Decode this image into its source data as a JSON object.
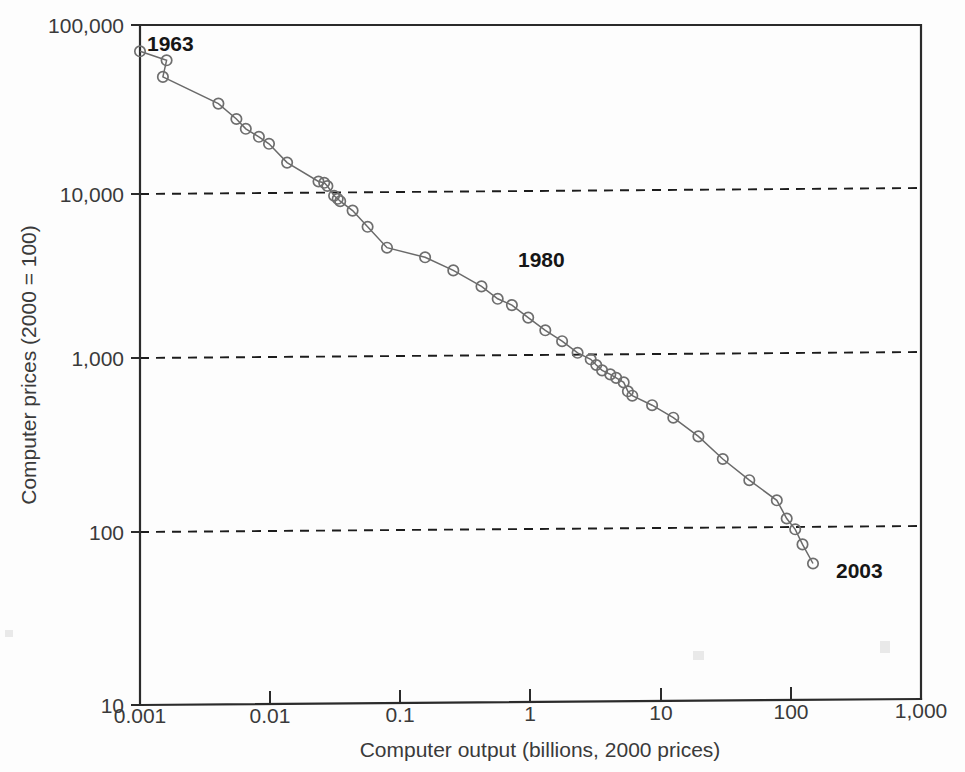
{
  "chart_data": {
    "type": "line",
    "title": "",
    "xlabel": "Computer output (billions, 2000 prices)",
    "ylabel": "Computer prices (2000 = 100)",
    "xscale": "log",
    "yscale": "log",
    "xlim": [
      0.001,
      1000
    ],
    "ylim": [
      10,
      100000
    ],
    "xticks": [
      0.001,
      0.01,
      0.1,
      1,
      10,
      100,
      1000
    ],
    "xtick_labels": [
      "0.001",
      "0.01",
      "0.1",
      "1",
      "10",
      "100",
      "1,000"
    ],
    "yticks": [
      10,
      100,
      1000,
      10000,
      100000
    ],
    "ytick_labels": [
      "10",
      "100",
      "1,000",
      "10,000",
      "100,000"
    ],
    "grid": "horizontal dashed gridlines at 100, 1,000 and 10,000",
    "legend": "none",
    "marker": "open circle",
    "series": [
      {
        "name": "Computer prices vs output",
        "x": [
          0.001,
          0.0016,
          0.0015,
          0.004,
          0.0055,
          0.0065,
          0.0082,
          0.0098,
          0.0135,
          0.0235,
          0.026,
          0.0275,
          0.031,
          0.033,
          0.0345,
          0.043,
          0.056,
          0.079,
          0.155,
          0.255,
          0.42,
          0.56,
          0.72,
          0.96,
          1.3,
          1.75,
          2.3,
          2.9,
          3.2,
          3.55,
          4.1,
          4.55,
          5.2,
          5.6,
          6.05,
          8.6,
          12.5,
          19.5,
          30.0,
          48.0,
          78.0,
          93.0,
          108,
          123,
          148
        ],
        "y": [
          70000,
          62000,
          49500,
          34500,
          28000,
          24500,
          22000,
          20000,
          15500,
          12000,
          11800,
          11300,
          9900,
          9500,
          9200,
          8100,
          6500,
          4900,
          4300,
          3600,
          2900,
          2450,
          2250,
          1900,
          1600,
          1380,
          1180,
          1080,
          1000,
          930,
          880,
          840,
          790,
          700,
          660,
          580,
          490,
          380,
          280,
          210,
          160,
          125,
          108,
          88,
          68
        ]
      }
    ],
    "annotations": [
      {
        "label": "1963",
        "x_value": 0.001,
        "y_value": 70000,
        "note": "first observation, top-left"
      },
      {
        "label": "1980",
        "x_value": 1.0,
        "y_value": 1800,
        "note": "mid-series label"
      },
      {
        "label": "2003",
        "x_value": 148,
        "y_value": 68,
        "note": "last observation, bottom-right"
      }
    ]
  },
  "colors": {
    "axis": "#2b2b2b",
    "gridline": "#1c1c1c",
    "series_line": "#6a6a6a",
    "marker_stroke": "#6e6e6e",
    "tick_label": "#3a3a3a",
    "annotation": "#161616",
    "background": "#fdfdfd"
  },
  "axes": {
    "x_title": "Computer output (billions, 2000 prices)",
    "y_title": "Computer prices (2000 = 100)"
  },
  "x_tick_labels": {
    "t0": "0.001",
    "t1": "0.01",
    "t2": "0.1",
    "t3": "1",
    "t4": "10",
    "t5": "100",
    "t6": "1,000"
  },
  "y_tick_labels": {
    "t0": "10",
    "t1": "100",
    "t2": "1,000",
    "t3": "10,000",
    "t4": "100,000"
  },
  "annotations": {
    "first": "1963",
    "middle": "1980",
    "last": "2003"
  }
}
